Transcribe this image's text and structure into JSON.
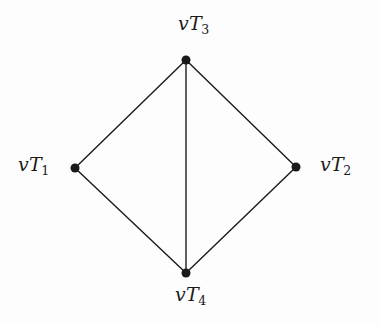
{
  "figure": {
    "type": "undirected-graph-diagram",
    "width": 379,
    "height": 325,
    "background_color": "#fdfdfd",
    "stroke_color": "#1a1a1a",
    "node_fill_color": "#1a1a1a",
    "node_radius": 4.5,
    "edge_width": 1.4
  },
  "nodes": [
    {
      "id": "T3",
      "label_base": "v",
      "label_sub_letter": "T",
      "label_sub_index": "3",
      "label_text": "vT3",
      "x": 186,
      "y": 60,
      "label_position": "above"
    },
    {
      "id": "T1",
      "label_base": "v",
      "label_sub_letter": "T",
      "label_sub_index": "1",
      "label_text": "vT1",
      "x": 75,
      "y": 168,
      "label_position": "left"
    },
    {
      "id": "T2",
      "label_base": "v",
      "label_sub_letter": "T",
      "label_sub_index": "2",
      "label_text": "vT2",
      "x": 296,
      "y": 167,
      "label_position": "right"
    },
    {
      "id": "T4",
      "label_base": "v",
      "label_sub_letter": "T",
      "label_sub_index": "4",
      "label_text": "vT4",
      "x": 186,
      "y": 273,
      "label_position": "below"
    }
  ],
  "edges": [
    {
      "id": "edge-t1-t3",
      "from": "T1",
      "to": "T3",
      "x1": 75,
      "y1": 168,
      "x2": 186,
      "y2": 60
    },
    {
      "id": "edge-t3-t2",
      "from": "T3",
      "to": "T2",
      "x1": 186,
      "y1": 60,
      "x2": 296,
      "y2": 167
    },
    {
      "id": "edge-t3-t4",
      "from": "T3",
      "to": "T4",
      "x1": 186,
      "y1": 60,
      "x2": 186,
      "y2": 273
    },
    {
      "id": "edge-t1-t4",
      "from": "T1",
      "to": "T4",
      "x1": 75,
      "y1": 168,
      "x2": 186,
      "y2": 273
    },
    {
      "id": "edge-t2-t4",
      "from": "T2",
      "to": "T4",
      "x1": 296,
      "y1": 167,
      "x2": 186,
      "y2": 273
    }
  ]
}
